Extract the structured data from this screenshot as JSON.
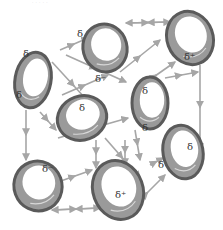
{
  "caption": "· · · · ·",
  "colors": {
    "ring_outer": "#5a5a5a",
    "ring_fill": "#9a9a9a",
    "ring_highlight": "#d8d8d8",
    "arrow": "#a6a6a6",
    "background": "#ffffff"
  },
  "rings": [
    {
      "id": "ring-top-center",
      "cx": 105,
      "cy": 48,
      "rx": 22,
      "ry": 24,
      "rot": -15,
      "labels": [
        {
          "text": "δ",
          "x": 77,
          "y": 37
        },
        {
          "text": "δ⁻",
          "x": 95,
          "y": 82
        }
      ]
    },
    {
      "id": "ring-top-right",
      "cx": 190,
      "cy": 38,
      "rx": 23,
      "ry": 27,
      "rot": -20,
      "labels": [
        {
          "text": "δ⁺",
          "x": 184,
          "y": 60
        }
      ]
    },
    {
      "id": "ring-left",
      "cx": 33,
      "cy": 80,
      "rx": 18,
      "ry": 28,
      "rot": 10,
      "labels": [
        {
          "text": "δ",
          "x": 23,
          "y": 57
        },
        {
          "text": "δ",
          "x": 16,
          "y": 98
        }
      ]
    },
    {
      "id": "ring-center-left",
      "cx": 82,
      "cy": 118,
      "rx": 25,
      "ry": 22,
      "rot": -20,
      "labels": [
        {
          "text": "δ",
          "x": 79,
          "y": 111
        }
      ]
    },
    {
      "id": "ring-center-right",
      "cx": 150,
      "cy": 103,
      "rx": 18,
      "ry": 26,
      "rot": 0,
      "labels": [
        {
          "text": "δ",
          "x": 142,
          "y": 94
        },
        {
          "text": "δ",
          "x": 142,
          "y": 131
        }
      ]
    },
    {
      "id": "ring-bottom-left",
      "cx": 38,
      "cy": 186,
      "rx": 24,
      "ry": 25,
      "rot": -20,
      "labels": [
        {
          "text": "δ⁻",
          "x": 42,
          "y": 172
        }
      ]
    },
    {
      "id": "ring-bottom-center",
      "cx": 118,
      "cy": 190,
      "rx": 25,
      "ry": 30,
      "rot": -20,
      "labels": [
        {
          "text": "δ⁺",
          "x": 115,
          "y": 198
        }
      ]
    },
    {
      "id": "ring-bottom-right",
      "cx": 183,
      "cy": 152,
      "rx": 20,
      "ry": 27,
      "rot": -10,
      "labels": [
        {
          "text": "δ",
          "x": 187,
          "y": 150
        },
        {
          "text": "δ",
          "x": 158,
          "y": 168
        }
      ]
    }
  ],
  "arrows": [
    [
      60,
      50,
      88,
      38
    ],
    [
      126,
      23,
      170,
      22
    ],
    [
      170,
      22,
      126,
      23
    ],
    [
      52,
      62,
      96,
      110
    ],
    [
      40,
      112,
      56,
      130
    ],
    [
      66,
      55,
      126,
      82
    ],
    [
      120,
      72,
      160,
      40
    ],
    [
      138,
      88,
      175,
      62
    ],
    [
      200,
      65,
      200,
      150
    ],
    [
      26,
      110,
      26,
      160
    ],
    [
      58,
      182,
      92,
      170
    ],
    [
      52,
      210,
      100,
      208
    ],
    [
      100,
      208,
      52,
      210
    ],
    [
      96,
      140,
      96,
      168
    ],
    [
      105,
      138,
      140,
      178
    ],
    [
      125,
      140,
      125,
      165
    ],
    [
      135,
      130,
      140,
      160
    ],
    [
      150,
      165,
      163,
      158
    ],
    [
      130,
      210,
      165,
      175
    ],
    [
      165,
      78,
      198,
      72
    ],
    [
      62,
      95,
      108,
      75
    ],
    [
      58,
      138,
      128,
      118
    ]
  ]
}
